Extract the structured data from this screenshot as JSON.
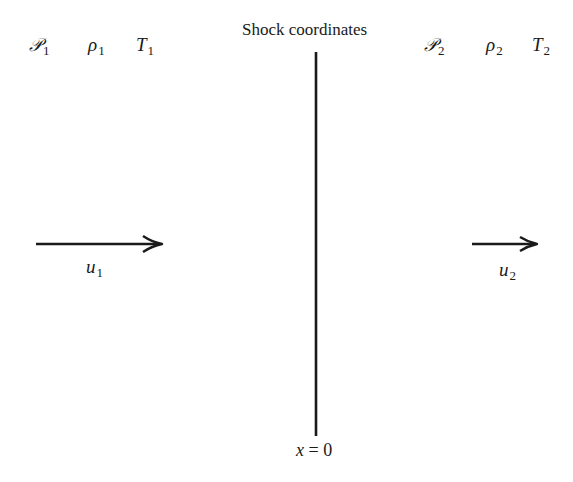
{
  "title": "Shock coordinates",
  "upstream": {
    "pressure": {
      "symbol": "𝒫",
      "subscript": "1"
    },
    "density": {
      "symbol": "ρ",
      "subscript": "1"
    },
    "temperature": {
      "symbol": "T",
      "subscript": "1"
    },
    "velocity": {
      "symbol": "u",
      "subscript": "1"
    }
  },
  "downstream": {
    "pressure": {
      "symbol": "𝒫",
      "subscript": "2"
    },
    "density": {
      "symbol": "ρ",
      "subscript": "2"
    },
    "temperature": {
      "symbol": "T",
      "subscript": "2"
    },
    "velocity": {
      "symbol": "u",
      "subscript": "2"
    }
  },
  "shock": {
    "origin_variable": "x",
    "origin_equals": " = ",
    "origin_value": "0"
  },
  "colors": {
    "ink": "#1a1a1a",
    "background": "#ffffff"
  }
}
